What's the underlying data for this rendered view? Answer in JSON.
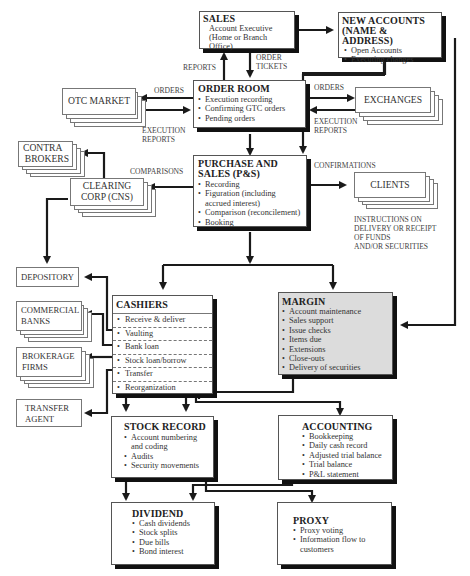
{
  "nodes": {
    "sales": {
      "title": "SALES",
      "lines": [
        "Account Executive",
        "(Home or Branch Office)"
      ]
    },
    "new_accounts": {
      "title_1": "NEW ACCOUNTS",
      "title_2": "(NAME & ADDRESS)",
      "items": [
        "Open Accounts",
        "Executing changes"
      ]
    },
    "order_room": {
      "title": "ORDER ROOM",
      "items": [
        "Execution recording",
        "Confirming GTC orders",
        "Pending orders"
      ]
    },
    "otc_market": {
      "title": "OTC MARKET"
    },
    "exchanges": {
      "title": "EXCHANGES"
    },
    "contra_brokers": {
      "line_1": "CONTRA",
      "line_2": "BROKERS"
    },
    "clearing_corp": {
      "line_1": "CLEARING",
      "line_2": "CORP (CNS)"
    },
    "purchase_sales": {
      "title_1": "PURCHASE AND",
      "title_2": "SALES (P&S)",
      "items": [
        "Recording",
        "Figuration (including",
        "accrued interest)",
        "Comparison (reconcilement)",
        "Booking"
      ]
    },
    "clients": {
      "title": "CLIENTS",
      "note": [
        "INSTRUCTIONS ON",
        "DELIVERY OR RECEIPT",
        "OF FUNDS",
        "AND/OR SECURITIES"
      ]
    },
    "depository": {
      "title": "DEPOSITORY"
    },
    "commercial_banks": {
      "line_1": "COMMERCIAL",
      "line_2": "BANKS"
    },
    "brokerage_firms": {
      "line_1": "BROKERAGE",
      "line_2": "FIRMS"
    },
    "transfer_agent": {
      "line_1": "TRANSFER",
      "line_2": "AGENT"
    },
    "cashiers": {
      "title": "CASHIERS",
      "items": [
        "Receive & deliver",
        "Vaulting",
        "Bank loan",
        "Stock loan/borrow",
        "Transfer",
        "Reorganization"
      ]
    },
    "margin": {
      "title": "MARGIN",
      "items": [
        "Account maintenance",
        "Sales support",
        "Issue checks",
        "Items due",
        "Extensions",
        "Close-outs",
        "Delivery of securities"
      ]
    },
    "stock_record": {
      "title": "STOCK RECORD",
      "items": [
        "Account numbering",
        "and coding",
        "Audits",
        "Security movements"
      ]
    },
    "accounting": {
      "title": "ACCOUNTING",
      "items": [
        "Bookkeeping",
        "Daily cash record",
        "Adjusted trial balance",
        "Trial balance",
        "P&L statement"
      ]
    },
    "dividend": {
      "title": "DIVIDEND",
      "items": [
        "Cash dividends",
        "Stock splits",
        "Due bills",
        "Bond interest"
      ]
    },
    "proxy": {
      "title": "PROXY",
      "items": [
        "Proxy voting",
        "Information flow to",
        "customers"
      ]
    }
  },
  "edge_labels": {
    "reports": "REPORTS",
    "order_tickets_1": "ORDER",
    "order_tickets_2": "TICKETS",
    "orders_left": "ORDERS",
    "exec_reports_left_1": "EXECUTION",
    "exec_reports_left_2": "REPORTS",
    "orders_right": "ORDERS",
    "exec_reports_right_1": "EXECUTION",
    "exec_reports_right_2": "REPORTS",
    "comparisons": "COMPARISONS",
    "confirmations": "CONFIRMATIONS"
  },
  "colors": {
    "line": "#1a1a1a",
    "shadow": "#111111",
    "margin_fill": "#dcdcdc",
    "box_border": "#555555"
  }
}
